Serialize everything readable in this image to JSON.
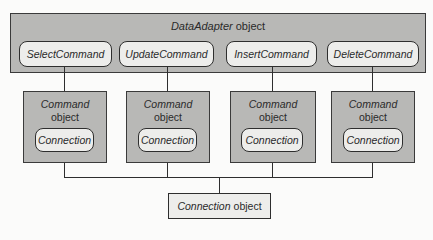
{
  "diagram": {
    "adapter": {
      "title_italic": "DataAdapter",
      "title_rest": "object",
      "commands": [
        {
          "label": "SelectCommand"
        },
        {
          "label": "UpdateCommand"
        },
        {
          "label": "InsertCommand"
        },
        {
          "label": "DeleteCommand"
        }
      ]
    },
    "command_objects": [
      {
        "title_italic": "Command",
        "title_rest": "object",
        "connection_label": "Connection"
      },
      {
        "title_italic": "Command",
        "title_rest": "object",
        "connection_label": "Connection"
      },
      {
        "title_italic": "Command",
        "title_rest": "object",
        "connection_label": "Connection"
      },
      {
        "title_italic": "Command",
        "title_rest": "object",
        "connection_label": "Connection"
      }
    ],
    "connection_object": {
      "title_italic": "Connection",
      "title_rest": "object"
    },
    "colors": {
      "box_fill": "#b8b8b6",
      "pill_fill": "#ededeb",
      "stroke": "#2e2e2e",
      "background": "#fbfbfa"
    }
  }
}
